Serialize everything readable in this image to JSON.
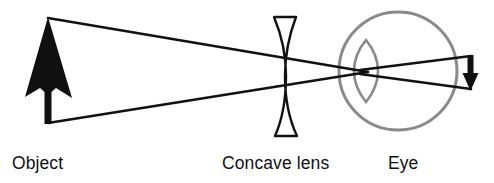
{
  "figure": {
    "background_color": "#ffffff",
    "width": 494,
    "height": 183
  },
  "colors": {
    "ink": "#101010",
    "ray": "#111111",
    "eye_outline": "#8a8a8a",
    "eye_cornea": "#8a8a8a",
    "lens_outline": "#111111",
    "background": "#ffffff"
  },
  "labels": {
    "object": "Object",
    "lens": "Concave lens",
    "eye": "Eye"
  },
  "elements": {
    "object_arrow": {
      "name": "Object",
      "description": "thick solid black arrow pointing up",
      "tip_x": 48,
      "tip_y": 18,
      "base_x": 48,
      "base_y": 123,
      "head_width": 44,
      "head_height": 62,
      "shaft_width": 7,
      "fill": "#101010"
    },
    "concave_lens": {
      "name": "Concave lens",
      "description": "biconcave diverging lens, outline only",
      "center_x": 288,
      "top_y": 16,
      "bottom_y": 136,
      "height": 120,
      "edge_thickness": 17,
      "waist_thickness": 4,
      "stroke": "#111111",
      "stroke_width": 2.4
    },
    "eye": {
      "name": "Eye",
      "description": "gray circular eyeball with lens-shaped cornea at front",
      "center_x": 398,
      "center_y": 71,
      "radius": 59,
      "stroke": "#8a8a8a",
      "stroke_width": 3,
      "cornea": {
        "center_x": 366,
        "center_y": 71,
        "half_width": 12,
        "half_height": 31,
        "stroke": "#8a8a8a",
        "stroke_width": 2.6
      }
    },
    "image_arrow": {
      "name": "Retinal image",
      "description": "small inverted arrow at the retina pointing down-right",
      "x": 470,
      "top_y": 57,
      "bottom_y": 90,
      "fill": "#101010"
    },
    "rays": {
      "description": "two straight rays from object tip and base crossing at the eye lens then reaching the retina",
      "crossing_x": 368,
      "crossing_y": 72,
      "stroke": "#111111",
      "stroke_width": 2.6,
      "paths": [
        {
          "name": "upper-ray",
          "from_x": 48,
          "from_y": 18,
          "to_x": 368,
          "to_y": 72
        },
        {
          "name": "lower-ray",
          "from_x": 48,
          "from_y": 123,
          "to_x": 368,
          "to_y": 72
        },
        {
          "name": "upper-ray-in-eye",
          "from_x": 368,
          "from_y": 72,
          "to_x": 470,
          "to_y": 57
        },
        {
          "name": "lower-ray-in-eye",
          "from_x": 368,
          "from_y": 72,
          "to_x": 470,
          "to_y": 88
        }
      ]
    }
  },
  "label_positions": {
    "object": {
      "x": 12,
      "y": 169
    },
    "lens": {
      "x": 222,
      "y": 169
    },
    "eye": {
      "x": 388,
      "y": 169
    }
  }
}
